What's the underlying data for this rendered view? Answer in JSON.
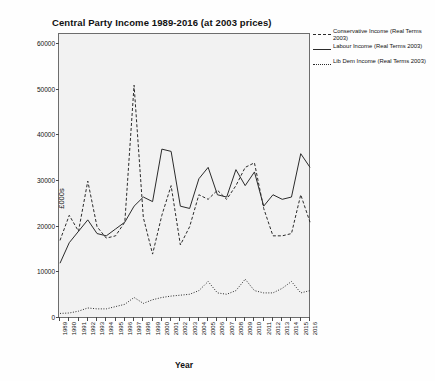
{
  "chart_data": {
    "type": "line",
    "title": "Central Party Income 1989-2016 (at 2003 prices)",
    "xlabel": "Year",
    "ylabel": "£000s",
    "grid": false,
    "legend_position": "right",
    "ylim": [
      0,
      62000
    ],
    "yticks": [
      0,
      10000,
      20000,
      30000,
      40000,
      50000,
      60000
    ],
    "ytick_labels": [
      "0",
      "10000",
      "20000",
      "30000",
      "40000",
      "50000",
      "60000"
    ],
    "categories": [
      "1989",
      "1990",
      "1991",
      "1992",
      "1993",
      "1994",
      "1995",
      "1996",
      "1997",
      "1998",
      "1999",
      "2000",
      "2001",
      "2002",
      "2003",
      "2004",
      "2005",
      "2006",
      "2007",
      "2008",
      "2009",
      "2010",
      "2011",
      "2012",
      "2013",
      "2014",
      "2015",
      "2016"
    ],
    "series": [
      {
        "name": "Conservative Income (Real Terms 2003)",
        "style": "dashed",
        "color": "#2b2b2b",
        "values": [
          17000,
          22500,
          19000,
          30000,
          20000,
          17500,
          18000,
          21000,
          51000,
          22000,
          14000,
          22500,
          29000,
          16000,
          20000,
          27000,
          26000,
          28000,
          26000,
          29000,
          33000,
          34000,
          24000,
          18000,
          18000,
          18500,
          27000,
          21000
        ]
      },
      {
        "name": "Labour Income (Real Terms 2003)",
        "style": "solid",
        "color": "#2b2b2b",
        "values": [
          12000,
          16500,
          19000,
          21500,
          18500,
          18000,
          19500,
          21000,
          24500,
          26500,
          25500,
          37000,
          36500,
          24500,
          24000,
          30500,
          33000,
          27000,
          26500,
          32500,
          29000,
          32000,
          24500,
          27000,
          26000,
          26500,
          36000,
          33000
        ]
      },
      {
        "name": "Lib Dem Income (Real Terms 2003)",
        "style": "dotted",
        "color": "#2b2b2b",
        "values": [
          1000,
          1100,
          1500,
          2200,
          2000,
          2000,
          2500,
          3000,
          4500,
          3200,
          4000,
          4500,
          4800,
          5000,
          5200,
          6000,
          8000,
          5500,
          5200,
          6000,
          8500,
          6000,
          5500,
          5500,
          6500,
          8000,
          5500,
          6000
        ]
      }
    ]
  }
}
